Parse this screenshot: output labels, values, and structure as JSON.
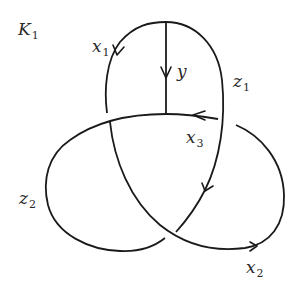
{
  "title": {
    "main": "K",
    "sub": "1"
  },
  "labels": {
    "x1": {
      "main": "x",
      "sub": "1"
    },
    "y": {
      "main": "y",
      "sub": ""
    },
    "z1": {
      "main": "z",
      "sub": "1"
    },
    "x3": {
      "main": "x",
      "sub": "3"
    },
    "z2": {
      "main": "z",
      "sub": "2"
    },
    "x2": {
      "main": "x",
      "sub": "2"
    }
  },
  "colors": {
    "stroke": "#1a1a1a",
    "background": "#ffffff"
  }
}
